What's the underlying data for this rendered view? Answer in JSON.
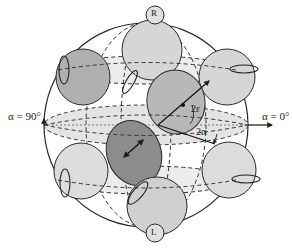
{
  "figure": {
    "type": "poincare-sphere",
    "axis_labels": {
      "left": "α = 90°",
      "right": "α = 0°"
    },
    "angle_labels": {
      "ellipticity": "2ε",
      "azimuth": "2α"
    },
    "pole_labels": {
      "north": "R",
      "south": "L"
    },
    "colors": {
      "sphere_fill": "#ffffff",
      "equator_band": "#e6e6e6",
      "latitude_band": "#ececec",
      "light_disc": "#d9d9d9",
      "mid_disc": "#b3b3b3",
      "dark_disc": "#8c8c8c",
      "stroke": "#2a2a2a"
    }
  }
}
